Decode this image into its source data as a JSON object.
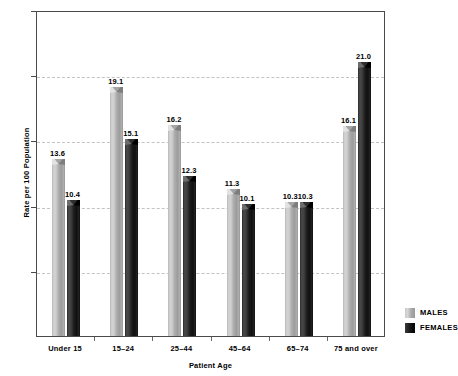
{
  "chart_data": {
    "type": "bar",
    "title": "",
    "xlabel": "Patient Age",
    "ylabel": "Rate per 100 Population",
    "categories": [
      "Under 15",
      "15–24",
      "25–44",
      "45–64",
      "65–74",
      "75 and over"
    ],
    "series": [
      {
        "name": "MALES",
        "color": "#b4b4b4",
        "values": [
          13.6,
          19.1,
          16.2,
          11.3,
          10.3,
          16.1
        ]
      },
      {
        "name": "FEMALES",
        "color": "#111111",
        "values": [
          10.4,
          15.1,
          12.3,
          10.1,
          10.3,
          21.0
        ]
      }
    ],
    "value_labels": {
      "MALES": [
        "13.6",
        "19.1",
        "16.2",
        "11.3",
        "10.3",
        "16.1"
      ],
      "FEMALES": [
        "10.4",
        "15.1",
        "12.3",
        "10.1",
        "10.3",
        "21.0"
      ]
    },
    "ylim": [
      0,
      25
    ],
    "yticks": [
      5,
      10,
      15,
      20,
      25
    ],
    "ytick_labels": [
      "5",
      "10",
      "15",
      "20",
      "25"
    ],
    "grid": true,
    "grid_style": "dashed",
    "grid_color": "#c3c3c3",
    "legend_position": "bottom-right-outside"
  },
  "legend": {
    "items": [
      {
        "label": "MALES",
        "swatch": "males"
      },
      {
        "label": "FEMALES",
        "swatch": "females"
      }
    ]
  }
}
